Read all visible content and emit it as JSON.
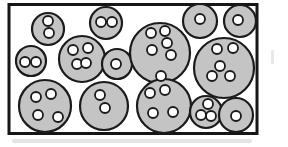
{
  "diagram": {
    "type": "particle-model",
    "canvas": {
      "width": 288,
      "height": 147
    },
    "box": {
      "x": 9,
      "y": 4.5,
      "width": 248,
      "height": 129,
      "stroke_width": 3
    },
    "colors": {
      "background": "#ffffff",
      "box_stroke": "#161616",
      "box_fill": "#ffffff",
      "molecule_fill": "#c4c4c4",
      "molecule_stroke": "#1b1b1b",
      "atom_fill": "#ffffff",
      "atom_stroke": "#1b1b1b",
      "scan_artifact": "#d9d9d6"
    },
    "stroke": {
      "molecule": 2.2,
      "atom": 1.8
    },
    "atom_radius": 5,
    "molecules": [
      {
        "cx": 48,
        "cy": 29,
        "r": 16,
        "atoms": [
          [
            48,
            21
          ],
          [
            49,
            33
          ]
        ]
      },
      {
        "cx": 106,
        "cy": 23,
        "r": 16,
        "atoms": [
          [
            101,
            22
          ],
          [
            112,
            22
          ]
        ]
      },
      {
        "cx": 31,
        "cy": 61,
        "r": 15,
        "atoms": [
          [
            25,
            62
          ],
          [
            36,
            62
          ]
        ]
      },
      {
        "cx": 82,
        "cy": 59,
        "r": 23,
        "atoms": [
          [
            73,
            50
          ],
          [
            88,
            48
          ],
          [
            77,
            64
          ],
          [
            86,
            63
          ]
        ]
      },
      {
        "cx": 117,
        "cy": 64,
        "r": 15,
        "atoms": [
          [
            116,
            64
          ]
        ]
      },
      {
        "cx": 160,
        "cy": 53,
        "r": 30,
        "atoms": [
          [
            151,
            33
          ],
          [
            165,
            31
          ],
          [
            167,
            43
          ],
          [
            152,
            50
          ],
          [
            171,
            55
          ]
        ]
      },
      {
        "cx": 200,
        "cy": 21,
        "r": 17,
        "atoms": [
          [
            200,
            19
          ]
        ]
      },
      {
        "cx": 240,
        "cy": 21,
        "r": 16,
        "atoms": [
          [
            238,
            20
          ]
        ]
      },
      {
        "cx": 224,
        "cy": 68,
        "r": 30,
        "atoms": [
          [
            217,
            49
          ],
          [
            233,
            48
          ],
          [
            220,
            66
          ],
          [
            212,
            76
          ],
          [
            230,
            76
          ]
        ]
      },
      {
        "cx": 45,
        "cy": 106,
        "r": 26,
        "atoms": [
          [
            36,
            97
          ],
          [
            51,
            94
          ],
          [
            38,
            115
          ],
          [
            58,
            117
          ]
        ]
      },
      {
        "cx": 104,
        "cy": 106,
        "r": 24,
        "atoms": [
          [
            100,
            95
          ],
          [
            105,
            108
          ]
        ]
      },
      {
        "cx": 164,
        "cy": 106,
        "r": 27,
        "atoms": [
          [
            150,
            93
          ],
          [
            165,
            90
          ],
          [
            153,
            113
          ],
          [
            173,
            112
          ]
        ]
      },
      {
        "cx": 206,
        "cy": 112,
        "r": 16,
        "atoms": [
          [
            208,
            104
          ],
          [
            201,
            115
          ],
          [
            211,
            116
          ]
        ]
      },
      {
        "cx": 236,
        "cy": 115,
        "r": 17,
        "atoms": [
          [
            236,
            116
          ]
        ]
      }
    ],
    "free_atoms": [
      [
        161,
        76
      ]
    ],
    "artifacts": {
      "bottom_shadow": {
        "x": 12,
        "y": 139,
        "width": 240,
        "height": 4
      },
      "right_smudge": {
        "x": 271,
        "y": 50,
        "width": 3,
        "height": 14
      }
    }
  }
}
